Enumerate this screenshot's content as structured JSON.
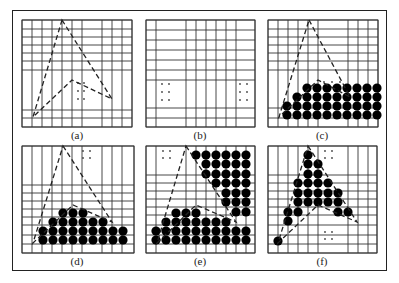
{
  "figure": {
    "colors": {
      "grid": "#333333",
      "polygon": "#222222",
      "fill_dot": "#000000",
      "border": "#222222"
    },
    "panels": [
      {
        "id": "a",
        "label": "(a)",
        "label_pos": [
          77,
          136
        ],
        "vlines": [
          22,
          32,
          42,
          52,
          62,
          72,
          82,
          102,
          112,
          122,
          132
        ],
        "hlines": [
          20,
          29,
          37,
          45,
          53,
          61,
          70,
          110,
          118,
          127
        ],
        "grid_box": [
          22,
          20,
          132,
          127
        ],
        "polygon": [
          [
            62,
            20
          ],
          [
            112,
            99
          ],
          [
            72,
            80
          ],
          [
            33,
            117
          ]
        ],
        "dots": [],
        "small_dots": [
          [
            78,
            83
          ],
          [
            84,
            83
          ],
          [
            78,
            91
          ],
          [
            84,
            91
          ],
          [
            78,
            99
          ],
          [
            84,
            99
          ]
        ]
      },
      {
        "id": "b",
        "label": "(b)",
        "label_pos": [
          200,
          136
        ],
        "vlines": [
          146,
          156,
          186,
          196,
          206,
          216,
          226,
          236,
          255
        ],
        "hlines": [
          20,
          30,
          40,
          50,
          60,
          70,
          80,
          108,
          118,
          127
        ],
        "grid_box": [
          146,
          20,
          255,
          127
        ],
        "polygon": [],
        "dots": [],
        "small_dots": [
          [
            162,
            84
          ],
          [
            169,
            84
          ],
          [
            162,
            92
          ],
          [
            169,
            92
          ],
          [
            162,
            100
          ],
          [
            169,
            100
          ],
          [
            240,
            84
          ],
          [
            247,
            84
          ],
          [
            240,
            92
          ],
          [
            247,
            92
          ],
          [
            240,
            100
          ],
          [
            247,
            100
          ]
        ]
      },
      {
        "id": "c",
        "label": "(c)",
        "label_pos": [
          322,
          136
        ],
        "vlines": [
          268,
          278,
          288,
          298,
          308,
          318,
          348,
          358,
          368,
          378
        ],
        "hlines": [
          20,
          29,
          37,
          45,
          53,
          61,
          70,
          108,
          118,
          127
        ],
        "grid_box": [
          268,
          20,
          378,
          127
        ],
        "polygon": [
          [
            309,
            20
          ],
          [
            350,
            97
          ],
          [
            318,
            80
          ],
          [
            279,
            117
          ]
        ],
        "dots": "c",
        "small_dots": [
          [
            324,
            82
          ],
          [
            332,
            82
          ],
          [
            340,
            82
          ]
        ]
      },
      {
        "id": "d",
        "label": "(d)",
        "label_pos": [
          77,
          262
        ],
        "vlines": [
          22,
          32,
          42,
          52,
          62,
          72,
          82,
          102,
          112,
          122,
          134
        ],
        "hlines": [
          146,
          185,
          193,
          201,
          209,
          217,
          225,
          235,
          244,
          253
        ],
        "grid_box": [
          22,
          146,
          134,
          253
        ],
        "polygon": [
          [
            63,
            146
          ],
          [
            112,
            222
          ],
          [
            73,
            205
          ],
          [
            33,
            243
          ]
        ],
        "dots": "d",
        "small_dots": [
          [
            83,
            151
          ],
          [
            90,
            151
          ],
          [
            83,
            158
          ],
          [
            90,
            158
          ]
        ]
      },
      {
        "id": "e",
        "label": "(e)",
        "label_pos": [
          200,
          262
        ],
        "vlines": [
          146,
          156,
          186,
          196,
          206,
          216,
          226,
          236,
          246,
          255
        ],
        "hlines": [
          146,
          175,
          183,
          191,
          199,
          207,
          215,
          225,
          235,
          244,
          253
        ],
        "grid_box": [
          146,
          146,
          255,
          253
        ],
        "polygon": [
          [
            186,
            146
          ],
          [
            236,
            222
          ],
          [
            196,
            205
          ],
          [
            157,
            243
          ]
        ],
        "dots": "e",
        "small_dots": [
          [
            163,
            151
          ],
          [
            170,
            151
          ],
          [
            163,
            158
          ],
          [
            170,
            158
          ]
        ]
      },
      {
        "id": "f",
        "label": "(f)",
        "label_pos": [
          322,
          262
        ],
        "vlines": [
          268,
          278,
          288,
          298,
          308,
          318,
          348,
          358,
          368,
          377
        ],
        "hlines": [
          146,
          175,
          183,
          191,
          199,
          207,
          215,
          225,
          235,
          244,
          253
        ],
        "grid_box": [
          268,
          146,
          377,
          253
        ],
        "polygon": [
          [
            308,
            146
          ],
          [
            357,
            222
          ],
          [
            318,
            205
          ],
          [
            278,
            243
          ]
        ],
        "dots": "f",
        "small_dots": [
          [
            325,
            151
          ],
          [
            332,
            151
          ],
          [
            325,
            158
          ],
          [
            332,
            158
          ],
          [
            325,
            232
          ],
          [
            332,
            232
          ],
          [
            325,
            239
          ],
          [
            332,
            239
          ]
        ]
      }
    ],
    "dot_rows": {
      "c": [
        [
          88,
          307,
          377
        ],
        [
          97,
          297,
          377
        ],
        [
          106,
          287,
          377
        ],
        [
          115,
          287,
          377
        ]
      ],
      "d": [
        [
          213,
          63,
          83
        ],
        [
          222,
          53,
          112
        ],
        [
          231,
          43,
          132
        ],
        [
          240,
          43,
          132
        ]
      ],
      "e": [
        [
          155,
          196,
          252
        ],
        [
          164,
          206,
          252
        ],
        [
          174,
          206,
          252
        ],
        [
          183,
          216,
          252
        ],
        [
          193,
          226,
          252
        ],
        [
          202,
          226,
          252
        ],
        [
          212,
          236,
          252
        ],
        [
          213,
          176,
          196
        ],
        [
          222,
          166,
          226
        ],
        [
          231,
          156,
          252
        ],
        [
          240,
          156,
          252
        ]
      ],
      "f": [
        [
          155,
          308,
          308
        ],
        [
          164,
          308,
          318
        ],
        [
          174,
          308,
          318
        ],
        [
          183,
          298,
          328
        ],
        [
          193,
          298,
          338
        ],
        [
          202,
          298,
          338
        ],
        [
          212,
          288,
          298
        ],
        [
          212,
          338,
          348
        ],
        [
          221,
          288,
          288
        ],
        [
          241,
          278,
          278
        ]
      ]
    }
  }
}
